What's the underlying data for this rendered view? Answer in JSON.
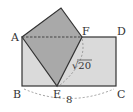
{
  "diagram": {
    "type": "geometry-figure",
    "colors": {
      "rectangle_fill": "#dadada",
      "folded_fill": "#a9a9a9",
      "stroke": "#333333",
      "dashed": "#555555",
      "arc": "#888888"
    },
    "points": {
      "A": {
        "label": "A",
        "x": 22,
        "y": 37
      },
      "B": {
        "label": "B",
        "x": 22,
        "y": 86
      },
      "C": {
        "label": "C",
        "x": 116,
        "y": 86
      },
      "D": {
        "label": "D",
        "x": 116,
        "y": 37
      },
      "E": {
        "label": "E",
        "x": 57,
        "y": 86
      },
      "F": {
        "label": "F",
        "x": 82,
        "y": 37
      },
      "top": {
        "x": 61,
        "y": 8
      }
    },
    "measurements": {
      "BC": "8",
      "EF": "√20"
    }
  }
}
